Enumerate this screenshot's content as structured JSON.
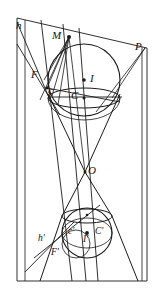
{
  "figure": {
    "width": 158,
    "height": 292,
    "background_color": "#ffffff",
    "stroke_color": "#1a1a1a",
    "apex_label": "O"
  },
  "labels": [
    {
      "id": "h",
      "text": "h",
      "x": 16,
      "y": 20,
      "size": "normal"
    },
    {
      "id": "M",
      "text": "M",
      "x": 52,
      "y": 30,
      "size": "normal"
    },
    {
      "id": "P",
      "text": "P",
      "x": 135,
      "y": 41,
      "size": "normal"
    },
    {
      "id": "F",
      "text": "F",
      "x": 31,
      "y": 69,
      "size": "normal"
    },
    {
      "id": "I",
      "text": "I",
      "x": 90,
      "y": 73,
      "size": "normal"
    },
    {
      "id": "c",
      "text": "c",
      "x": 48,
      "y": 85,
      "size": "normal"
    },
    {
      "id": "C",
      "text": "C",
      "x": 71,
      "y": 90,
      "size": "normal"
    },
    {
      "id": "O",
      "text": "O",
      "x": 88,
      "y": 165,
      "size": "normal"
    },
    {
      "id": "c-prime",
      "text": "c'",
      "x": 68,
      "y": 227,
      "size": "small"
    },
    {
      "id": "C-prime",
      "text": "C'",
      "x": 95,
      "y": 227,
      "size": "small"
    },
    {
      "id": "I-prime",
      "text": "I'",
      "x": 83,
      "y": 235,
      "size": "small"
    },
    {
      "id": "h-prime",
      "text": "h'",
      "x": 38,
      "y": 234,
      "size": "small"
    },
    {
      "id": "F-prime",
      "text": "F'",
      "x": 51,
      "y": 248,
      "size": "small"
    }
  ],
  "points": [
    {
      "id": "point-M",
      "x": 69,
      "y": 37,
      "r": 2.0
    },
    {
      "id": "point-I",
      "x": 84,
      "y": 80,
      "r": 1.8
    },
    {
      "id": "point-C",
      "x": 84,
      "y": 98,
      "r": 1.6
    },
    {
      "id": "point-F",
      "x": 47,
      "y": 88,
      "r": 1.6
    },
    {
      "id": "point-O",
      "x": 85,
      "y": 172,
      "r": 1.6
    },
    {
      "id": "point-I-prime",
      "x": 87,
      "y": 233,
      "r": 1.9
    },
    {
      "id": "point-C-prime",
      "x": 87,
      "y": 215,
      "r": 1.4
    }
  ],
  "spheres": [
    {
      "id": "upper-sphere",
      "cx": 84,
      "cy": 80,
      "r": 36
    },
    {
      "id": "lower-sphere",
      "cx": 87,
      "cy": 233,
      "r": 25
    }
  ],
  "tangency_circles": [
    {
      "id": "upper-tangency-ellipse",
      "cx": 84,
      "cy": 98,
      "rx": 36,
      "ry": 10
    },
    {
      "id": "lower-tangency-ellipse",
      "cx": 87,
      "cy": 216,
      "rx": 25,
      "ry": 7
    }
  ],
  "plane": {
    "id": "cutting-plane-P",
    "corners": [
      {
        "x": 17,
        "y": 18
      },
      {
        "x": 147,
        "y": 48
      },
      {
        "x": 147,
        "y": 281
      },
      {
        "x": 17,
        "y": 281
      }
    ]
  },
  "cone_generators": [
    {
      "id": "generator-left",
      "x1": 48,
      "y1": 93,
      "x2": 85,
      "y2": 172
    },
    {
      "id": "generator-right",
      "x1": 120,
      "y1": 93,
      "x2": 85,
      "y2": 172
    }
  ],
  "caption": ""
}
